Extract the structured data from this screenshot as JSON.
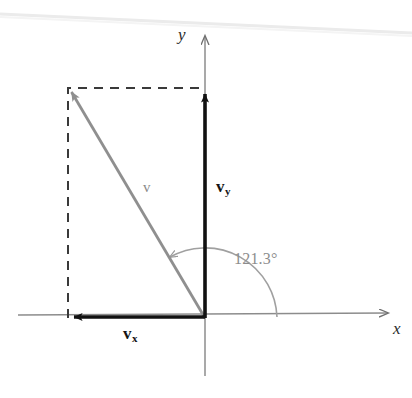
{
  "figure": {
    "name": "vector-decomposition-diagram",
    "type": "vector diagram",
    "background_color": "#ffffff",
    "axes": {
      "x_label": "x",
      "y_label": "y",
      "origin": [
        205,
        318
      ],
      "x_axis_color": "#8c8c8c",
      "y_axis_color": "#8c8c8c",
      "x_axis_start": [
        18,
        314
      ],
      "x_axis_end": [
        396,
        313
      ],
      "y_axis_top": [
        205,
        30
      ],
      "y_axis_bottom": [
        205,
        376
      ]
    },
    "vectors": [
      {
        "id": "resultant",
        "label": "v",
        "label_style": "italic-gray",
        "color": "#8f8f8f",
        "from": [
          205,
          318
        ],
        "to": [
          68,
          88
        ],
        "bold": false
      },
      {
        "id": "vy",
        "label": "v",
        "subscript": "y",
        "color": "#111111",
        "from": [
          205,
          318
        ],
        "to": [
          205,
          88
        ],
        "bold": true
      },
      {
        "id": "vx",
        "label": "v",
        "subscript": "x",
        "color": "#111111",
        "from": [
          205,
          318
        ],
        "to": [
          68,
          318
        ],
        "bold": true
      }
    ],
    "construction_lines": {
      "style": "dashed",
      "color": "#3a3a3a",
      "top_segment": [
        [
          68,
          88
        ],
        [
          205,
          88
        ]
      ],
      "left_segment": [
        [
          68,
          88
        ],
        [
          68,
          318
        ]
      ]
    },
    "angle": {
      "value": "121.3°",
      "numeric_value": 121.3,
      "unit": "degrees",
      "color": "#8d8d8d",
      "arc_radius": 72,
      "from_axis": "positive-x",
      "direction": "counterclockwise"
    },
    "scan_artifact": {
      "description": "faint page-edge line across top of scan",
      "color": "#e9e9e9",
      "from": [
        0,
        14
      ],
      "to": [
        412,
        34
      ]
    }
  }
}
